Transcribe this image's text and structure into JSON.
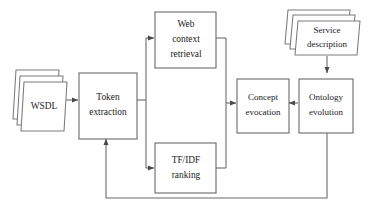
{
  "diagram": {
    "type": "flowchart",
    "colors": {
      "background": "#ffffff",
      "stroke": "#6b6b6b",
      "text": "#1a1a1a"
    },
    "nodes": [
      {
        "id": "wsdl",
        "shape": "document-stack",
        "lines": [
          "WSDL"
        ],
        "line1": "WSDL"
      },
      {
        "id": "token_extraction",
        "shape": "rect",
        "lines": [
          "Token",
          "extraction"
        ],
        "line1": "Token",
        "line2": "extraction"
      },
      {
        "id": "web_context_retrieval",
        "shape": "rect",
        "lines": [
          "Web",
          "context",
          "retrieval"
        ],
        "line1": "Web",
        "line2": "context",
        "line3": "retrieval"
      },
      {
        "id": "tfidf_ranking",
        "shape": "rect",
        "lines": [
          "TF/IDF",
          "ranking"
        ],
        "line1": "TF/IDF",
        "line2": "ranking"
      },
      {
        "id": "concept_evocation",
        "shape": "rect",
        "lines": [
          "Concept",
          "evocation"
        ],
        "line1": "Concept",
        "line2": "evocation"
      },
      {
        "id": "ontology_evolution",
        "shape": "rect",
        "lines": [
          "Ontology",
          "evolution"
        ],
        "line1": "Ontology",
        "line2": "evolution"
      },
      {
        "id": "service_description",
        "shape": "document-stack",
        "lines": [
          "Service",
          "description"
        ],
        "line1": "Service",
        "line2": "description"
      }
    ],
    "edges": [
      {
        "id": "wsdl-to-token",
        "from": "wsdl",
        "to": "token_extraction",
        "arrow": true
      },
      {
        "id": "token-to-web-context",
        "from": "token_extraction",
        "to": "web_context_retrieval",
        "arrow": true
      },
      {
        "id": "token-to-tfidf",
        "from": "token_extraction",
        "to": "tfidf_ranking",
        "arrow": true
      },
      {
        "id": "web-context-to-concept",
        "from": "web_context_retrieval",
        "to": "concept_evocation",
        "arrow": true
      },
      {
        "id": "tfidf-to-concept",
        "from": "tfidf_ranking",
        "to": "concept_evocation",
        "arrow": true
      },
      {
        "id": "ontology-to-concept",
        "from": "ontology_evolution",
        "to": "concept_evocation",
        "arrow": true
      },
      {
        "id": "service-description-to-ontology",
        "from": "service_description",
        "to": "ontology_evolution",
        "arrow": true
      },
      {
        "id": "ontology-feedback-to-token",
        "from": "ontology_evolution",
        "to": "token_extraction",
        "arrow": true
      }
    ]
  }
}
